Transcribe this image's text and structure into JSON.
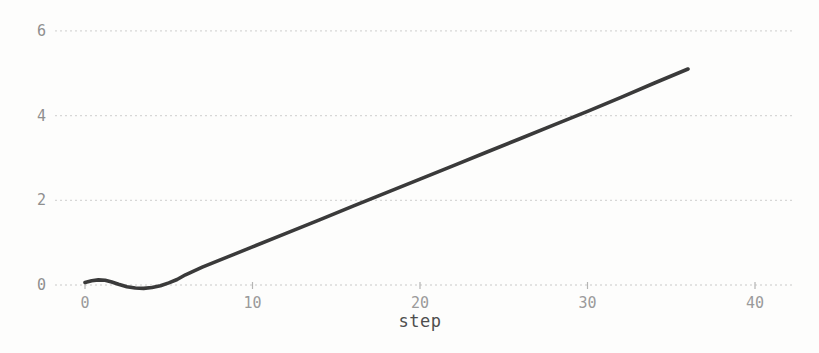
{
  "chart": {
    "background": "#fdfdfc",
    "line_color": "#3a3a3a",
    "grid_color": "#d7d7d6",
    "baseline_color": "#c9c9c8",
    "tick_mark_color": "#b5b5b4",
    "ytick_label_color": "#8f8f8f",
    "xtick_label_color": "#9a9a9a",
    "xlabel_color": "#4e4e4e"
  },
  "chart_data": {
    "type": "line",
    "title": "",
    "xlabel": "step",
    "ylabel": "",
    "legend": "none",
    "grid": "horizontal-dashed",
    "xticks": [
      0,
      10,
      20,
      30,
      40
    ],
    "yticks": [
      0,
      2,
      4,
      6
    ],
    "xlim": [
      -1.7,
      42.2
    ],
    "ylim": [
      -0.6,
      6.7
    ],
    "x": [
      0,
      0.4,
      0.8,
      1.2,
      1.6,
      2.0,
      2.5,
      3.0,
      3.5,
      4.0,
      4.5,
      5.0,
      5.5,
      6.0,
      7.0,
      8.0,
      9.0,
      10,
      12,
      14,
      16,
      18,
      20,
      22,
      24,
      26,
      28,
      30,
      32,
      34,
      36
    ],
    "y": [
      0.06,
      0.1,
      0.12,
      0.11,
      0.07,
      0.02,
      -0.04,
      -0.07,
      -0.08,
      -0.06,
      -0.02,
      0.05,
      0.13,
      0.24,
      0.42,
      0.58,
      0.74,
      0.9,
      1.22,
      1.54,
      1.86,
      2.18,
      2.5,
      2.82,
      3.14,
      3.46,
      3.78,
      4.1,
      4.43,
      4.77,
      5.1
    ]
  }
}
